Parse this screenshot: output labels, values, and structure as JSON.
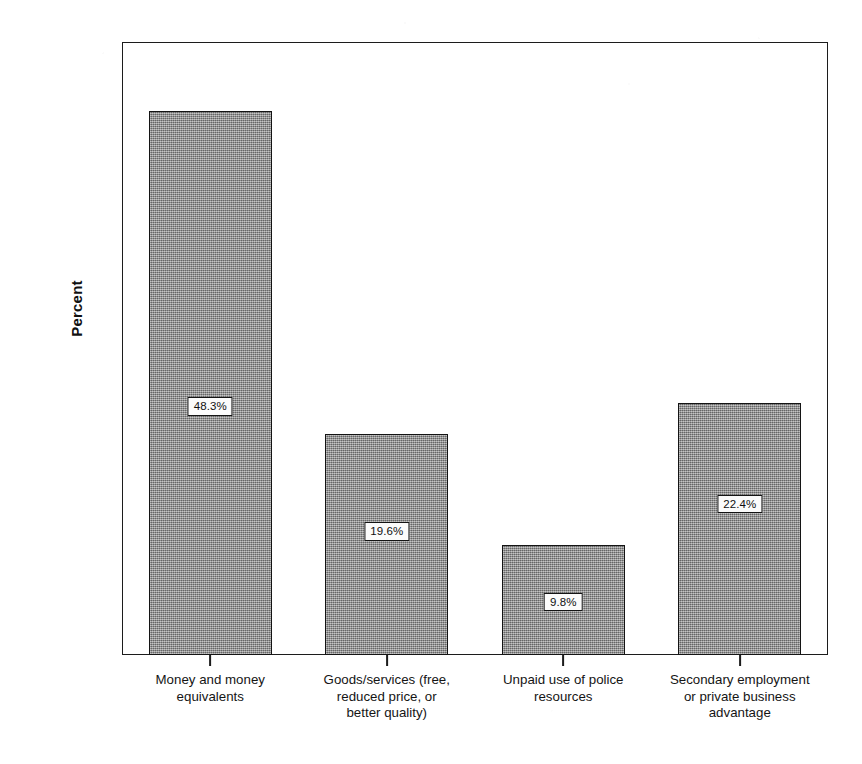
{
  "chart_data": {
    "type": "bar",
    "title": "",
    "subtitle": "",
    "xlabel": "",
    "ylabel": "Percent",
    "ylim": [
      0,
      53
    ],
    "grid": false,
    "legend": false,
    "legend_position": "none",
    "value_format": "percent",
    "categories": [
      "Money and money equivalents",
      "Goods/services (free, reduced price, or better quality)",
      "Unpaid use of police resources",
      "Secondary employment or private business advantage"
    ],
    "category_lines": [
      [
        "Money and money",
        "equivalents"
      ],
      [
        "Goods/services (free,",
        "reduced price, or",
        "better quality)"
      ],
      [
        "Unpaid use of police",
        "resources"
      ],
      [
        "Secondary employment",
        "or private business",
        "advantage"
      ]
    ],
    "values": [
      48.3,
      19.6,
      9.8,
      22.4
    ],
    "data_labels": [
      "48.3%",
      "19.6%",
      "9.8%",
      "22.4%"
    ],
    "y_ticks": [
      0,
      10,
      20,
      30,
      40,
      50
    ],
    "y_tick_labels": [
      "0.0%",
      "10.0%",
      "20.0%",
      "30.0%",
      "40.0%",
      "50.0%"
    ],
    "colors": {
      "bar_fill": "#8d8d8d",
      "bar_edge": "#141414",
      "axis": "#1c1c1c",
      "text": "#151515",
      "label_box_fill": "#fbfbfb",
      "plot_background": "#ffffff"
    }
  }
}
